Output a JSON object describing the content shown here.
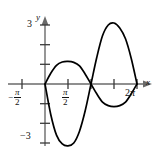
{
  "chart_data": {
    "type": "line",
    "title": "",
    "xlabel": "x",
    "ylabel": "y",
    "xlim": [
      -1.5707963,
      6.80678
    ],
    "ylim": [
      -3.6,
      3.6
    ],
    "grid": false,
    "legend": false,
    "x_tick_labels": [
      "-π/2",
      "π/2",
      "2π"
    ],
    "y_tick_labels": [
      "3",
      "-3"
    ],
    "x_ticks_unlabeled": [
      0,
      3.14159,
      4.712389
    ],
    "y_ticks_unlabeled": [
      2,
      1,
      -1,
      -2
    ],
    "series": [
      {
        "name": "small-amplitude-curve",
        "x": [
          0,
          0.3927,
          0.7854,
          1.1781,
          1.5708,
          1.9635,
          2.3562,
          2.7489,
          3.14159,
          3.5343,
          3.927,
          4.3197,
          4.712389,
          5.1051,
          5.4978,
          5.8905,
          6.28319
        ],
        "y": [
          0,
          0.55,
          0.95,
          1.12,
          1.15,
          1.1,
          0.92,
          0.5,
          0,
          -0.5,
          -0.92,
          -1.1,
          -1.15,
          -1.1,
          -0.92,
          -0.5,
          0
        ]
      },
      {
        "name": "large-amplitude-curve",
        "x": [
          0,
          0.3927,
          0.7854,
          1.1781,
          1.5708,
          1.9635,
          2.3562,
          2.7489,
          3.14159,
          3.5343,
          3.927,
          4.3197,
          4.712389,
          5.1051,
          5.4978,
          5.8905,
          6.28319
        ],
        "y": [
          0,
          -1.55,
          -2.6,
          -3.05,
          -3.15,
          -3.0,
          -2.4,
          -1.35,
          0,
          1.35,
          2.45,
          3.0,
          3.1,
          2.85,
          2.3,
          1.3,
          0
        ]
      }
    ],
    "annotations": {
      "y_axis_name": "y",
      "x_axis_name": "x",
      "top_tick_value": "3",
      "bottom_tick_value": "-3",
      "left_tick_value": "-π/2",
      "mid_tick_value": "π/2",
      "right_tick_value": "2π"
    },
    "style": {
      "curve_color": "#000000",
      "axis_color": "#666666",
      "background": "#ffffff",
      "curve_width": 1.6
    }
  },
  "labels": {
    "y_axis": "y",
    "x_axis": "x",
    "three": "3",
    "minus_three": "−3",
    "pi": "π",
    "two": "2",
    "two_pi_number": "2",
    "minus_sign": "−"
  }
}
